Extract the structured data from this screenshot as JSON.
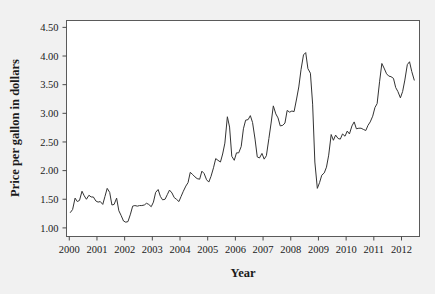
{
  "figure": {
    "background_color": "#f1f1f1",
    "plot_background_color": "#ffffff",
    "frame_color": "#5a5a5a"
  },
  "chart_data": {
    "type": "line",
    "title": "",
    "xlabel": "Year",
    "ylabel": "Price per gallon in dollars",
    "xlim": [
      1999.9,
      2012.65
    ],
    "ylim": [
      0.85,
      4.62
    ],
    "grid": false,
    "legend": null,
    "line_color": "#333333",
    "xticks": [
      2000,
      2001,
      2002,
      2003,
      2004,
      2005,
      2006,
      2007,
      2008,
      2009,
      2010,
      2011,
      2012
    ],
    "xtick_labels": [
      "2000",
      "2001",
      "2002",
      "2003",
      "2004",
      "2005",
      "2006",
      "2007",
      "2008",
      "2009",
      "2010",
      "2011",
      "2012"
    ],
    "yticks": [
      1.0,
      1.5,
      2.0,
      2.5,
      3.0,
      3.5,
      4.0,
      4.5
    ],
    "ytick_labels": [
      "1.00",
      "1.50",
      "2.00",
      "2.50",
      "3.00",
      "3.50",
      "4.00",
      "4.50"
    ],
    "x": [
      2000.04,
      2000.12,
      2000.21,
      2000.29,
      2000.37,
      2000.46,
      2000.54,
      2000.62,
      2000.71,
      2000.79,
      2000.87,
      2000.96,
      2001.04,
      2001.12,
      2001.21,
      2001.29,
      2001.37,
      2001.46,
      2001.54,
      2001.62,
      2001.71,
      2001.79,
      2001.87,
      2001.96,
      2002.04,
      2002.12,
      2002.21,
      2002.29,
      2002.37,
      2002.46,
      2002.54,
      2002.62,
      2002.71,
      2002.79,
      2002.87,
      2002.96,
      2003.04,
      2003.12,
      2003.21,
      2003.29,
      2003.37,
      2003.46,
      2003.54,
      2003.62,
      2003.71,
      2003.79,
      2003.87,
      2003.96,
      2004.04,
      2004.12,
      2004.21,
      2004.29,
      2004.37,
      2004.46,
      2004.54,
      2004.62,
      2004.71,
      2004.79,
      2004.87,
      2004.96,
      2005.04,
      2005.12,
      2005.21,
      2005.29,
      2005.37,
      2005.46,
      2005.54,
      2005.62,
      2005.71,
      2005.79,
      2005.87,
      2005.96,
      2006.04,
      2006.12,
      2006.21,
      2006.29,
      2006.37,
      2006.46,
      2006.54,
      2006.62,
      2006.71,
      2006.79,
      2006.87,
      2006.96,
      2007.04,
      2007.12,
      2007.21,
      2007.29,
      2007.37,
      2007.46,
      2007.54,
      2007.62,
      2007.71,
      2007.79,
      2007.87,
      2007.96,
      2008.04,
      2008.12,
      2008.21,
      2008.29,
      2008.37,
      2008.46,
      2008.54,
      2008.62,
      2008.71,
      2008.79,
      2008.87,
      2008.96,
      2009.04,
      2009.12,
      2009.21,
      2009.29,
      2009.37,
      2009.46,
      2009.54,
      2009.62,
      2009.71,
      2009.79,
      2009.87,
      2009.96,
      2010.04,
      2010.12,
      2010.21,
      2010.29,
      2010.37,
      2010.46,
      2010.54,
      2010.62,
      2010.71,
      2010.79,
      2010.87,
      2010.96,
      2011.04,
      2011.12,
      2011.21,
      2011.29,
      2011.37,
      2011.46,
      2011.54,
      2011.62,
      2011.71,
      2011.79,
      2011.87,
      2011.96,
      2012.04,
      2012.12,
      2012.21,
      2012.29,
      2012.37,
      2012.46
    ],
    "values": [
      1.27,
      1.32,
      1.52,
      1.46,
      1.48,
      1.64,
      1.56,
      1.5,
      1.57,
      1.54,
      1.54,
      1.47,
      1.45,
      1.46,
      1.41,
      1.55,
      1.69,
      1.62,
      1.4,
      1.41,
      1.52,
      1.3,
      1.22,
      1.12,
      1.1,
      1.11,
      1.24,
      1.38,
      1.39,
      1.38,
      1.39,
      1.39,
      1.4,
      1.43,
      1.41,
      1.37,
      1.45,
      1.62,
      1.67,
      1.55,
      1.49,
      1.5,
      1.58,
      1.66,
      1.61,
      1.53,
      1.5,
      1.46,
      1.55,
      1.64,
      1.73,
      1.79,
      1.97,
      1.93,
      1.89,
      1.86,
      1.85,
      1.99,
      1.95,
      1.84,
      1.8,
      1.9,
      2.05,
      2.21,
      2.18,
      2.15,
      2.29,
      2.48,
      2.94,
      2.76,
      2.25,
      2.18,
      2.31,
      2.31,
      2.42,
      2.73,
      2.88,
      2.89,
      2.96,
      2.84,
      2.55,
      2.24,
      2.22,
      2.3,
      2.2,
      2.26,
      2.56,
      2.83,
      3.13,
      2.99,
      2.92,
      2.78,
      2.79,
      2.83,
      3.05,
      3.02,
      3.04,
      3.03,
      3.25,
      3.46,
      3.76,
      4.02,
      4.06,
      3.78,
      3.7,
      3.16,
      2.15,
      1.69,
      1.79,
      1.92,
      1.96,
      2.06,
      2.27,
      2.63,
      2.53,
      2.62,
      2.56,
      2.55,
      2.64,
      2.6,
      2.69,
      2.64,
      2.78,
      2.85,
      2.73,
      2.74,
      2.74,
      2.72,
      2.7,
      2.79,
      2.85,
      2.95,
      3.1,
      3.17,
      3.56,
      3.87,
      3.79,
      3.69,
      3.65,
      3.64,
      3.61,
      3.45,
      3.38,
      3.27,
      3.38,
      3.58,
      3.85,
      3.9,
      3.73,
      3.58
    ]
  },
  "annotations": {
    "peak_2008": "4.06",
    "trough_2008": "1.69",
    "peak_2011": "3.87"
  }
}
